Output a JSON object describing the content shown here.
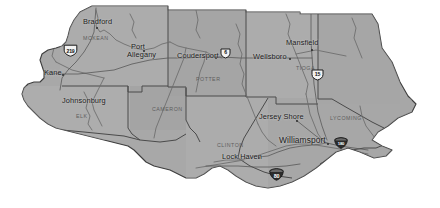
{
  "map": {
    "title": "North Central Pennsylvania Regional Map",
    "region": "North Central Pennsylvania",
    "background_color": "#ffffff",
    "land_fill": "#a8a8a8",
    "land_fill_light": "#b4b4b4",
    "border_color": "#3d3d3d",
    "county_line_color": "#5a5a5a",
    "river_color": "#6e6e6e",
    "label_color": "#1c1c1c",
    "county_label_color": "#5e5e5e"
  },
  "cities": [
    {
      "name": "Bradford",
      "x": 83,
      "y": 18,
      "dot_x": 96,
      "dot_y": 27,
      "align": "center"
    },
    {
      "name": "Port",
      "x": 131,
      "y": 43,
      "dot_x": null,
      "dot_y": null,
      "align": "center"
    },
    {
      "name": "Allegany",
      "x": 127,
      "y": 51,
      "dot_x": 143,
      "dot_y": 50,
      "align": "center"
    },
    {
      "name": "Kane",
      "x": 44,
      "y": 71,
      "dot_x": 62,
      "dot_y": 74,
      "align": "center"
    },
    {
      "name": "Coudersport",
      "x": 179,
      "y": 57,
      "dot_x": 215,
      "dot_y": 57,
      "align": "center"
    },
    {
      "name": "Wellsboro",
      "x": 256,
      "y": 58,
      "dot_x": 289,
      "dot_y": 58,
      "align": "center"
    },
    {
      "name": "Mansfield",
      "x": 288,
      "y": 42,
      "dot_x": 311,
      "dot_y": 49,
      "align": "center"
    },
    {
      "name": "Johnsonburg",
      "x": 62,
      "y": 100,
      "dot_x": null,
      "dot_y": null,
      "align": "center"
    },
    {
      "name": "Jersey Shore",
      "x": 261,
      "y": 116,
      "dot_x": 296,
      "dot_y": 120,
      "align": "center"
    },
    {
      "name": "Williamsport",
      "x": 280,
      "y": 137,
      "dot_x": 327,
      "dot_y": 143,
      "align": "center"
    },
    {
      "name": "Lock Haven",
      "x": 224,
      "y": 157,
      "dot_x": 258,
      "dot_y": 157,
      "align": "center"
    }
  ],
  "counties": [
    {
      "name": "MCKEAN",
      "x": 83,
      "y": 35
    },
    {
      "name": "POTTER",
      "x": 196,
      "y": 76
    },
    {
      "name": "TIOGA",
      "x": 296,
      "y": 65
    },
    {
      "name": "ELK",
      "x": 76,
      "y": 113
    },
    {
      "name": "CAMERON",
      "x": 152,
      "y": 106
    },
    {
      "name": "CLINTON",
      "x": 217,
      "y": 142
    },
    {
      "name": "LYCOMING",
      "x": 330,
      "y": 115
    }
  ],
  "route_shields": [
    {
      "route": "219",
      "type": "us",
      "x": 63,
      "y": 43,
      "label": "US 219"
    },
    {
      "route": "6",
      "type": "us",
      "x": 221,
      "y": 45,
      "label": "US 6"
    },
    {
      "route": "15",
      "type": "us",
      "x": 312,
      "y": 67,
      "label": "US 15"
    },
    {
      "route": "180",
      "type": "interstate",
      "x": 334,
      "y": 134,
      "label": "Interstate 180"
    },
    {
      "route": "80",
      "type": "interstate",
      "x": 269,
      "y": 167,
      "label": "Interstate 80"
    }
  ]
}
